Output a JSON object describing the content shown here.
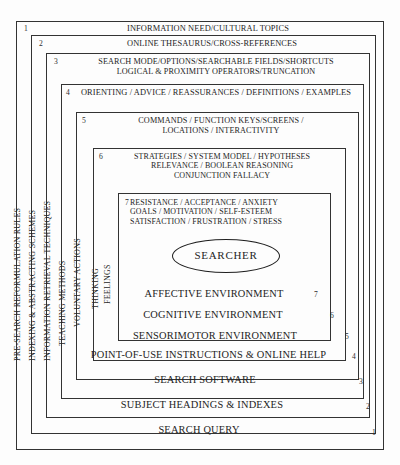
{
  "diagram": {
    "center": {
      "label": "SEARCHER",
      "shape": "ellipse"
    },
    "levels": [
      {
        "number": "1",
        "top_text": "INFORMATION NEED/CULTURAL TOPICS",
        "bottom_text": "SEARCH QUERY",
        "side_label": "PRE-SEARCH REFORMULATION RULES"
      },
      {
        "number": "2",
        "top_text": "ONLINE THESAURUS/CROSS-REFERENCES",
        "bottom_text": "SUBJECT HEADINGS & INDEXES",
        "side_label": "INDEXING & ABSTRACTING SCHEMES"
      },
      {
        "number": "3",
        "top_text": "SEARCH MODE/OPTIONS/SEARCHABLE FIELDS/SHORTCUTS\nLOGICAL & PROXIMITY OPERATORS/TRUNCATION",
        "bottom_text": "SEARCH SOFTWARE",
        "side_label": "INFORMATION RETRIEVAL TECHNIQUES"
      },
      {
        "number": "4",
        "top_text": "ORIENTING  /  ADVICE  /  REASSURANCES  /  DEFINITIONS  /  EXAMPLES",
        "bottom_text": "POINT-OF-USE INSTRUCTIONS & ONLINE HELP",
        "side_label": "TEACHING METHODS"
      },
      {
        "number": "5",
        "top_text": "COMMANDS / FUNCTION KEYS/SCREENS /\nLOCATIONS / INTERACTIVITY",
        "bottom_text": "SENSORIMOTOR ENVIRONMENT",
        "side_label": "VOLUNTARY ACTIONS"
      },
      {
        "number": "6",
        "top_text": "STRATEGIES / SYSTEM MODEL / HYPOTHESES\nRELEVANCE / BOOLEAN REASONING\nCONJUNCTION FALLACY",
        "bottom_text": "COGNITIVE ENVIRONMENT",
        "side_label": "THINKING"
      },
      {
        "number": "7",
        "top_text": "RESISTANCE / ACCEPTANCE / ANXIETY\nGOALS / MOTIVATION / SELF-ESTEEM\nSATISFACTION / FRUSTRATION / STRESS",
        "bottom_text": "AFFECTIVE ENVIRONMENT",
        "side_label": "FEELINGS"
      }
    ],
    "colors": {
      "background": "#fdfdfd",
      "border": "#333333",
      "text": "#242424"
    }
  }
}
